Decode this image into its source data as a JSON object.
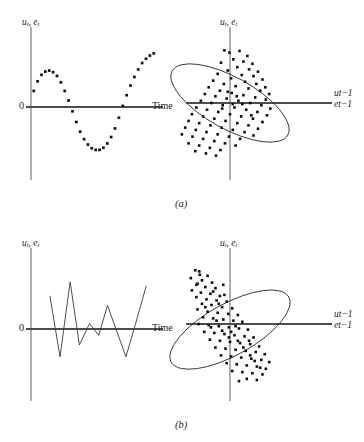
{
  "figure": {
    "background_color": "#ffffff",
    "ink_color": "#111111",
    "axis_vertical_color": "#8d8d8d",
    "axis_horizontal_color": "#4d4d4d",
    "subcaptions": [
      {
        "id": "a",
        "text": "(a)"
      },
      {
        "id": "b",
        "text": "(b)"
      }
    ]
  },
  "labels": {
    "y_axis_main": "u",
    "y_axis_main_sub": "t",
    "y_axis_second": "e",
    "y_axis_second_sub": "t",
    "y_axis_full": "uₜ, eₜ",
    "x_axis_time": "Time",
    "x_axis_lag_first": "u",
    "x_axis_lag_first_sub": "t−1",
    "x_axis_lag_second": "e",
    "x_axis_lag_second_sub": "t−1",
    "origin_zero": "0"
  },
  "chart_data": [
    {
      "id": "panel-a-left",
      "type": "scatter",
      "title": "",
      "subtitle": "Positive autocorrelation: smooth cyclical residual pattern over time",
      "xlabel": "Time",
      "ylabel": "u_t, e_t",
      "xlim": [
        0,
        14
      ],
      "ylim": [
        -1.25,
        1.25
      ],
      "grid": false,
      "legend": "none",
      "marker": "square-dot",
      "x": [
        0.3,
        0.72,
        1.14,
        1.56,
        1.98,
        2.4,
        2.82,
        3.24,
        3.66,
        4.08,
        4.5,
        4.92,
        5.34,
        5.76,
        6.18,
        6.6,
        7.02,
        7.44,
        7.86,
        8.28,
        8.7,
        9.12,
        9.54,
        9.96,
        10.38,
        10.8,
        11.22,
        11.64,
        12.06,
        12.48,
        12.9,
        13.32
      ],
      "y": [
        0.3,
        0.48,
        0.6,
        0.66,
        0.68,
        0.65,
        0.58,
        0.46,
        0.3,
        0.12,
        -0.08,
        -0.28,
        -0.46,
        -0.6,
        -0.7,
        -0.77,
        -0.8,
        -0.8,
        -0.76,
        -0.68,
        -0.56,
        -0.4,
        -0.2,
        0.02,
        0.22,
        0.4,
        0.56,
        0.7,
        0.82,
        0.9,
        0.96,
        1.0
      ]
    },
    {
      "id": "panel-a-right",
      "type": "scatter",
      "title": "",
      "subtitle": "Positive autocorrelation: lagged scatter with upward-tilted concentration ellipse",
      "xlabel": "u_{t-1}, e_{t-1}",
      "ylabel": "u_t, e_t",
      "xlim": [
        -1.6,
        1.6
      ],
      "ylim": [
        -1.6,
        1.6
      ],
      "grid": false,
      "legend": "none",
      "ellipse": {
        "center_x": 0.0,
        "center_y": 0.0,
        "semi_major": 1.18,
        "semi_minor": 0.46,
        "rotation_deg": -61,
        "correlation_sign": "positive"
      },
      "n_points": 92,
      "points": [
        [
          -0.1,
          0.94
        ],
        [
          -0.01,
          0.9
        ],
        [
          0.17,
          0.93
        ],
        [
          0.31,
          0.84
        ],
        [
          0.06,
          0.78
        ],
        [
          0.24,
          0.74
        ],
        [
          0.4,
          0.7
        ],
        [
          -0.16,
          0.72
        ],
        [
          0.13,
          0.64
        ],
        [
          0.34,
          0.6
        ],
        [
          0.5,
          0.56
        ],
        [
          -0.04,
          0.58
        ],
        [
          0.21,
          0.5
        ],
        [
          0.42,
          0.48
        ],
        [
          0.58,
          0.42
        ],
        [
          -0.22,
          0.52
        ],
        [
          0.02,
          0.44
        ],
        [
          0.27,
          0.38
        ],
        [
          0.47,
          0.34
        ],
        [
          0.63,
          0.28
        ],
        [
          -0.3,
          0.4
        ],
        [
          -0.11,
          0.34
        ],
        [
          0.1,
          0.3
        ],
        [
          0.33,
          0.26
        ],
        [
          0.54,
          0.22
        ],
        [
          0.7,
          0.16
        ],
        [
          -0.38,
          0.28
        ],
        [
          -0.18,
          0.22
        ],
        [
          0.03,
          0.18
        ],
        [
          0.24,
          0.14
        ],
        [
          0.45,
          0.1
        ],
        [
          0.64,
          0.06
        ],
        [
          -0.45,
          0.16
        ],
        [
          -0.26,
          0.12
        ],
        [
          -0.06,
          0.08
        ],
        [
          0.15,
          0.04
        ],
        [
          0.36,
          0.0
        ],
        [
          0.56,
          -0.04
        ],
        [
          0.72,
          -0.1
        ],
        [
          -0.52,
          0.04
        ],
        [
          -0.33,
          0.0
        ],
        [
          -0.13,
          -0.04
        ],
        [
          0.08,
          -0.08
        ],
        [
          0.29,
          -0.12
        ],
        [
          0.49,
          -0.16
        ],
        [
          0.66,
          -0.22
        ],
        [
          -0.6,
          -0.08
        ],
        [
          -0.41,
          -0.12
        ],
        [
          -0.21,
          -0.16
        ],
        [
          0.0,
          -0.2
        ],
        [
          0.2,
          -0.24
        ],
        [
          0.41,
          -0.28
        ],
        [
          0.58,
          -0.34
        ],
        [
          -0.68,
          -0.2
        ],
        [
          -0.48,
          -0.24
        ],
        [
          -0.28,
          -0.28
        ],
        [
          -0.08,
          -0.32
        ],
        [
          0.13,
          -0.36
        ],
        [
          0.33,
          -0.4
        ],
        [
          0.5,
          -0.46
        ],
        [
          -0.74,
          -0.32
        ],
        [
          -0.55,
          -0.36
        ],
        [
          -0.35,
          -0.4
        ],
        [
          -0.15,
          -0.44
        ],
        [
          0.05,
          -0.48
        ],
        [
          0.26,
          -0.52
        ],
        [
          0.42,
          -0.58
        ],
        [
          -0.8,
          -0.44
        ],
        [
          -0.61,
          -0.48
        ],
        [
          -0.42,
          -0.52
        ],
        [
          -0.22,
          -0.56
        ],
        [
          -0.02,
          -0.6
        ],
        [
          0.18,
          -0.64
        ],
        [
          -0.86,
          -0.56
        ],
        [
          -0.67,
          -0.6
        ],
        [
          -0.48,
          -0.64
        ],
        [
          -0.28,
          -0.68
        ],
        [
          -0.09,
          -0.72
        ],
        [
          0.1,
          -0.76
        ],
        [
          -0.74,
          -0.72
        ],
        [
          -0.55,
          -0.76
        ],
        [
          -0.36,
          -0.8
        ],
        [
          -0.17,
          -0.84
        ],
        [
          -0.62,
          -0.86
        ],
        [
          -0.43,
          -0.9
        ],
        [
          -0.25,
          -0.94
        ],
        [
          0.12,
          0.12
        ],
        [
          0.05,
          -0.02
        ],
        [
          -0.04,
          0.2
        ],
        [
          0.38,
          -0.22
        ],
        [
          -0.14,
          -0.1
        ],
        [
          0.22,
          -0.02
        ]
      ]
    },
    {
      "id": "panel-b-left",
      "type": "line",
      "title": "",
      "subtitle": "Negative autocorrelation: alternating sawtooth residual pattern over time",
      "xlabel": "Time",
      "ylabel": "u_t, e_t",
      "xlim": [
        0,
        14
      ],
      "ylim": [
        -1.25,
        1.25
      ],
      "grid": false,
      "legend": "none",
      "x": [
        2.05,
        3.15,
        4.25,
        5.25,
        6.35,
        7.35,
        8.3,
        9.35,
        10.3,
        11.35,
        12.5
      ],
      "y": [
        0.62,
        -0.52,
        0.88,
        -0.3,
        0.1,
        -0.12,
        0.44,
        -0.06,
        -0.52,
        0.1,
        0.8
      ]
    },
    {
      "id": "panel-b-right",
      "type": "scatter",
      "title": "",
      "subtitle": "Negative autocorrelation: lagged scatter with downward-tilted concentration ellipse",
      "xlabel": "u_{t-1}, e_{t-1}",
      "ylabel": "u_t, e_t",
      "xlim": [
        -1.6,
        1.6
      ],
      "ylim": [
        -1.6,
        1.6
      ],
      "grid": false,
      "legend": "none",
      "ellipse": {
        "center_x": 0.0,
        "center_y": -0.1,
        "semi_major": 1.2,
        "semi_minor": 0.46,
        "rotation_deg": 61,
        "correlation_sign": "negative"
      },
      "n_points": 92,
      "points": [
        [
          -0.62,
          0.96
        ],
        [
          -0.55,
          0.94
        ],
        [
          -0.54,
          0.88
        ],
        [
          -0.4,
          0.86
        ],
        [
          -0.7,
          0.82
        ],
        [
          -0.5,
          0.78
        ],
        [
          -0.32,
          0.74
        ],
        [
          -0.6,
          0.7
        ],
        [
          -0.44,
          0.66
        ],
        [
          -0.26,
          0.64
        ],
        [
          -0.12,
          0.7
        ],
        [
          -0.68,
          0.6
        ],
        [
          -0.52,
          0.56
        ],
        [
          -0.35,
          0.54
        ],
        [
          -0.18,
          0.5
        ],
        [
          -0.6,
          0.48
        ],
        [
          -0.42,
          0.44
        ],
        [
          -0.24,
          0.42
        ],
        [
          -0.06,
          0.4
        ],
        [
          -0.5,
          0.36
        ],
        [
          -0.33,
          0.34
        ],
        [
          -0.14,
          0.3
        ],
        [
          0.04,
          0.28
        ],
        [
          -0.58,
          0.26
        ],
        [
          -0.4,
          0.22
        ],
        [
          -0.22,
          0.2
        ],
        [
          -0.03,
          0.18
        ],
        [
          0.14,
          0.16
        ],
        [
          -0.48,
          0.12
        ],
        [
          -0.3,
          0.1
        ],
        [
          -0.12,
          0.08
        ],
        [
          0.06,
          0.06
        ],
        [
          0.22,
          0.04
        ],
        [
          -0.56,
          0.0
        ],
        [
          -0.38,
          -0.02
        ],
        [
          -0.2,
          -0.04
        ],
        [
          -0.02,
          -0.06
        ],
        [
          0.16,
          -0.08
        ],
        [
          0.32,
          -0.1
        ],
        [
          -0.46,
          -0.14
        ],
        [
          -0.28,
          -0.16
        ],
        [
          -0.1,
          -0.18
        ],
        [
          0.08,
          -0.2
        ],
        [
          0.26,
          -0.22
        ],
        [
          0.42,
          -0.24
        ],
        [
          -0.36,
          -0.28
        ],
        [
          -0.18,
          -0.3
        ],
        [
          0.0,
          -0.32
        ],
        [
          0.18,
          -0.34
        ],
        [
          0.36,
          -0.36
        ],
        [
          0.52,
          -0.4
        ],
        [
          -0.26,
          -0.42
        ],
        [
          -0.08,
          -0.44
        ],
        [
          0.1,
          -0.46
        ],
        [
          0.28,
          -0.48
        ],
        [
          0.46,
          -0.5
        ],
        [
          0.62,
          -0.54
        ],
        [
          -0.16,
          -0.56
        ],
        [
          0.02,
          -0.58
        ],
        [
          0.2,
          -0.6
        ],
        [
          0.38,
          -0.62
        ],
        [
          0.56,
          -0.64
        ],
        [
          0.7,
          -0.68
        ],
        [
          -0.06,
          -0.7
        ],
        [
          0.12,
          -0.72
        ],
        [
          0.3,
          -0.74
        ],
        [
          0.48,
          -0.76
        ],
        [
          0.64,
          -0.8
        ],
        [
          0.04,
          -0.84
        ],
        [
          0.22,
          -0.86
        ],
        [
          0.4,
          -0.88
        ],
        [
          0.58,
          -0.9
        ],
        [
          0.3,
          -0.98
        ],
        [
          0.48,
          -1.0
        ],
        [
          0.16,
          -1.02
        ],
        [
          -0.02,
          -0.24
        ],
        [
          -0.14,
          -0.12
        ],
        [
          0.1,
          -0.04
        ],
        [
          -0.24,
          0.06
        ],
        [
          0.34,
          -0.3
        ],
        [
          -0.44,
          0.3
        ],
        [
          0.02,
          -0.14
        ],
        [
          -0.34,
          -0.06
        ],
        [
          0.24,
          -0.42
        ],
        [
          -0.58,
          0.72
        ],
        [
          -0.3,
          0.58
        ],
        [
          0.44,
          -0.66
        ],
        [
          0.14,
          -0.3
        ],
        [
          -0.2,
          0.36
        ],
        [
          0.54,
          -0.78
        ],
        [
          -0.1,
          0.52
        ],
        [
          0.36,
          -0.56
        ]
      ]
    }
  ]
}
